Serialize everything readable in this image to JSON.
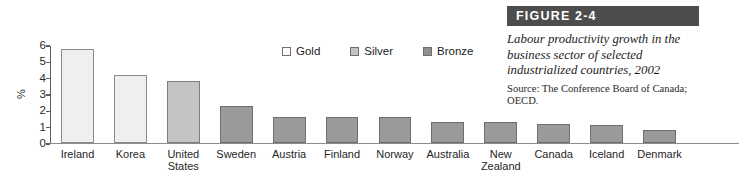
{
  "figure": {
    "banner_label": "FIGURE 2-4",
    "title": "Labour productivity growth in the business sector of selected industrialized countries, 2002",
    "source": "Source: The Conference Board of Canada; OECD.",
    "banner_color": "#4d4d4d"
  },
  "legend": {
    "items": [
      {
        "label": "Gold",
        "color": "#fdfdfd"
      },
      {
        "label": "Silver",
        "color": "#c4c4c4"
      },
      {
        "label": "Bronze",
        "color": "#8f8f8f"
      }
    ]
  },
  "axis": {
    "y_label": "%",
    "y_ticks": [
      "6",
      "5",
      "4",
      "3",
      "2",
      "1",
      "0"
    ]
  },
  "chart_data": {
    "type": "bar",
    "title": "Labour productivity growth in the business sector of selected industrialized countries, 2002",
    "xlabel": "",
    "ylabel": "%",
    "ylim": [
      0,
      6
    ],
    "yticks": [
      0,
      1,
      2,
      3,
      4,
      5,
      6
    ],
    "grid": false,
    "legend_position": "top-center",
    "categories": [
      "Ireland",
      "Korea",
      "United\nStates",
      "Sweden",
      "Austria",
      "Finland",
      "Norway",
      "Australia",
      "New\nZealand",
      "Canada",
      "Iceland",
      "Denmark"
    ],
    "values": [
      5.8,
      4.2,
      3.8,
      2.3,
      1.6,
      1.6,
      1.6,
      1.3,
      1.3,
      1.15,
      1.1,
      0.8
    ],
    "groups": [
      "Gold",
      "Gold",
      "Silver",
      "Bronze",
      "Bronze",
      "Bronze",
      "Bronze",
      "Bronze",
      "Bronze",
      "Bronze",
      "Bronze",
      "Bronze"
    ],
    "series": [
      {
        "name": "Labour productivity growth",
        "values": [
          5.8,
          4.2,
          3.8,
          2.3,
          1.6,
          1.6,
          1.6,
          1.3,
          1.3,
          1.15,
          1.1,
          0.8
        ]
      }
    ],
    "colors": {
      "Gold": "#efefef",
      "Silver": "#c4c4c4",
      "Bronze": "#9a9a9a"
    }
  }
}
